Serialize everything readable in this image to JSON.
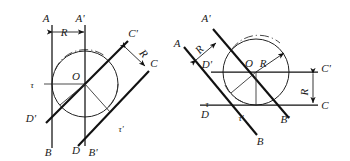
{
  "figure": {
    "background_color": "#ffffff",
    "ink_color": "#111111",
    "left_diagram": {
      "name": "left-construction",
      "circle": {
        "cx": 85,
        "cy": 84,
        "r": 33,
        "center_label": "O"
      },
      "labels": [
        {
          "id": "A",
          "text": "A",
          "x": 46,
          "y": 22
        },
        {
          "id": "Aprime",
          "text": "A'",
          "x": 80,
          "y": 22
        },
        {
          "id": "R-top",
          "text": "R",
          "x": 64,
          "y": 35
        },
        {
          "id": "tau",
          "text": "τ",
          "x": 32,
          "y": 88
        },
        {
          "id": "O",
          "text": "O",
          "x": 76,
          "y": 80
        },
        {
          "id": "Cprime",
          "text": "C'",
          "x": 131,
          "y": 37
        },
        {
          "id": "C",
          "text": "C",
          "x": 152,
          "y": 66
        },
        {
          "id": "R-diag",
          "text": "R",
          "x": 140,
          "y": 55
        },
        {
          "id": "Dprime",
          "text": "D'",
          "x": 29,
          "y": 121
        },
        {
          "id": "tauprime",
          "text": "τ'",
          "x": 119,
          "y": 131
        },
        {
          "id": "B",
          "text": "B",
          "x": 48,
          "y": 154
        },
        {
          "id": "D",
          "text": "D",
          "x": 77,
          "y": 153
        },
        {
          "id": "Bprime",
          "text": "B'",
          "x": 91,
          "y": 155
        }
      ]
    },
    "right_diagram": {
      "name": "right-construction",
      "circle": {
        "cx": 256,
        "cy": 72,
        "r": 33,
        "center_label": "O"
      },
      "labels": [
        {
          "id": "Aprime",
          "text": "A'",
          "x": 205,
          "y": 22
        },
        {
          "id": "A",
          "text": "A",
          "x": 177,
          "y": 46
        },
        {
          "id": "R-upper",
          "text": "R",
          "x": 203,
          "y": 51
        },
        {
          "id": "Dprime",
          "text": "D'",
          "x": 205,
          "y": 67
        },
        {
          "id": "O",
          "text": "O",
          "x": 248,
          "y": 66
        },
        {
          "id": "R-radius",
          "text": "R",
          "x": 262,
          "y": 66
        },
        {
          "id": "Cprime",
          "text": "C'",
          "x": 322,
          "y": 72
        },
        {
          "id": "C",
          "text": "C",
          "x": 323,
          "y": 108
        },
        {
          "id": "R-right",
          "text": "R",
          "x": 314,
          "y": 92
        },
        {
          "id": "tau",
          "text": "τ",
          "x": 206,
          "y": 106
        },
        {
          "id": "D",
          "text": "D",
          "x": 204,
          "y": 117
        },
        {
          "id": "tauprime",
          "text": "τ'",
          "x": 240,
          "y": 120
        },
        {
          "id": "Bprime",
          "text": "B'",
          "x": 283,
          "y": 122
        },
        {
          "id": "B",
          "text": "B",
          "x": 259,
          "y": 143
        }
      ]
    },
    "dimension_label": "R",
    "center_label": "O",
    "tau_label": "τ",
    "tau_prime_label": "τ'"
  }
}
